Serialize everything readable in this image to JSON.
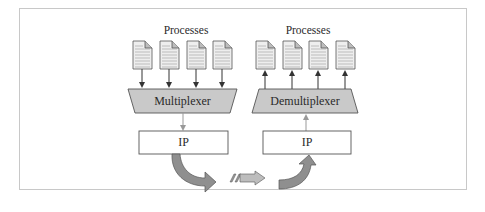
{
  "diagram": {
    "sender": {
      "processes_label": "Processes",
      "process_count": 4,
      "mux_label": "Multiplexer",
      "ip_label": "IP"
    },
    "receiver": {
      "processes_label": "Processes",
      "process_count": 4,
      "demux_label": "Demultiplexer",
      "ip_label": "IP"
    },
    "colors": {
      "trapezoid_fill": "#c9c9c9",
      "arrow_fill": "#8f8f8f",
      "border": "#555555",
      "frame": "#c8c8c8"
    }
  }
}
